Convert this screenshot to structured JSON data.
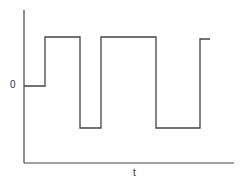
{
  "labels": {
    "y_origin": "0",
    "x_axis": "t"
  },
  "colors": {
    "stroke": "#444444",
    "background": "#ffffff"
  },
  "chart_data": {
    "type": "line",
    "title": "",
    "xlabel": "t",
    "ylabel": "",
    "y_tick_labels": [
      "0"
    ],
    "points_px": [
      [
        24,
        86
      ],
      [
        45,
        86
      ],
      [
        45,
        37
      ],
      [
        80,
        37
      ],
      [
        80,
        128
      ],
      [
        101,
        128
      ],
      [
        101,
        37
      ],
      [
        156,
        37
      ],
      [
        156,
        128
      ],
      [
        200,
        128
      ],
      [
        200,
        39
      ],
      [
        210,
        39
      ]
    ],
    "levels": {
      "zero": 0,
      "high": 1,
      "low": -1
    },
    "segments": [
      {
        "level": "zero",
        "x_start": 0,
        "x_end": 21
      },
      {
        "level": "high",
        "x_start": 21,
        "x_end": 56
      },
      {
        "level": "low",
        "x_start": 56,
        "x_end": 77
      },
      {
        "level": "high",
        "x_start": 77,
        "x_end": 132
      },
      {
        "level": "low",
        "x_start": 132,
        "x_end": 176
      },
      {
        "level": "high",
        "x_start": 176,
        "x_end": 186
      }
    ],
    "grid": false,
    "legend": null
  }
}
